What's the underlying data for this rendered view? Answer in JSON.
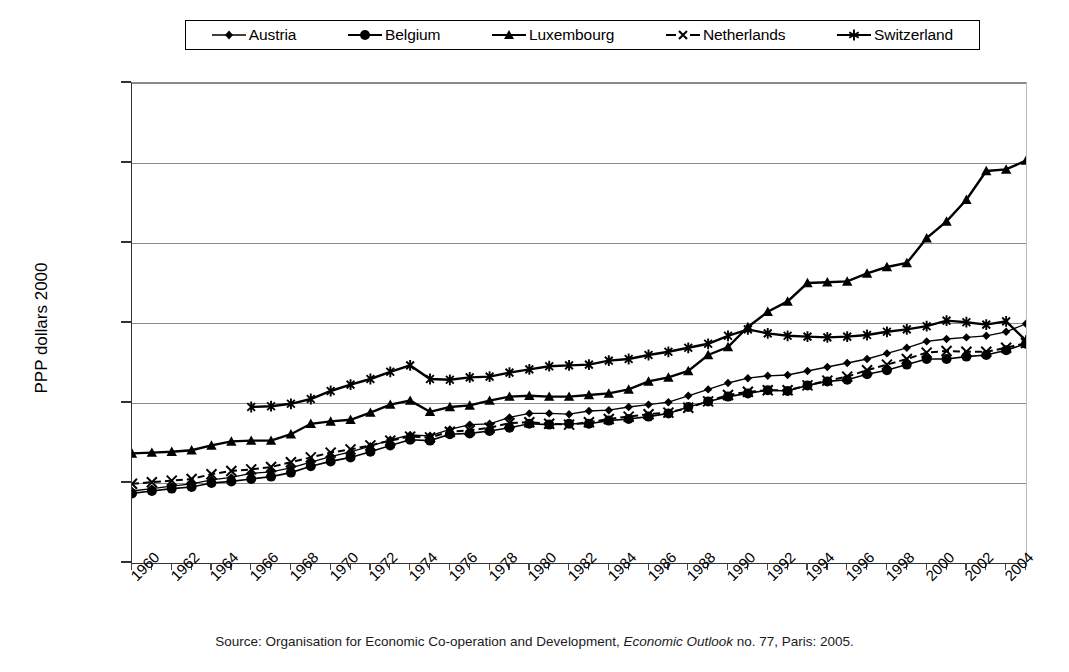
{
  "legend": {
    "items": [
      {
        "label": "Austria",
        "marker": "diamond",
        "line": "solid-thin"
      },
      {
        "label": "Belgium",
        "marker": "circle",
        "line": "solid-thin"
      },
      {
        "label": "Luxembourg",
        "marker": "triangle",
        "line": "solid-thick"
      },
      {
        "label": "Netherlands",
        "marker": "x",
        "line": "dashed"
      },
      {
        "label": "Switzerland",
        "marker": "asterisk",
        "line": "solid-thick"
      }
    ]
  },
  "axes": {
    "y_label": "PPP dollars 2000",
    "y_ticks": [
      "0",
      "10,000",
      "20,000",
      "30,000",
      "40,000",
      "50,000",
      "60,000"
    ],
    "x_ticks": [
      "1960",
      "1962",
      "1964",
      "1966",
      "1968",
      "1970",
      "1972",
      "1974",
      "1976",
      "1978",
      "1980",
      "1982",
      "1984",
      "1986",
      "1988",
      "1990",
      "1992",
      "1994",
      "1996",
      "1998",
      "2000",
      "2002",
      "2004"
    ]
  },
  "source": {
    "prefix": "Source: Organisation for Economic Co-operation and Development, ",
    "italic": "Economic Outlook",
    "suffix": " no. 77, Paris: 2005."
  },
  "chart_data": {
    "type": "line",
    "title": "",
    "xlabel": "",
    "ylabel": "PPP dollars 2000",
    "xlim": [
      1960,
      2005
    ],
    "ylim": [
      0,
      60000
    ],
    "ytick_step": 10000,
    "grid": true,
    "legend_position": "top",
    "x": [
      1960,
      1961,
      1962,
      1963,
      1964,
      1965,
      1966,
      1967,
      1968,
      1969,
      1970,
      1971,
      1972,
      1973,
      1974,
      1975,
      1976,
      1977,
      1978,
      1979,
      1980,
      1981,
      1982,
      1983,
      1984,
      1985,
      1986,
      1987,
      1988,
      1989,
      1990,
      1991,
      1992,
      1993,
      1994,
      1995,
      1996,
      1997,
      1998,
      1999,
      2000,
      2001,
      2002,
      2003,
      2004,
      2005
    ],
    "series": [
      {
        "name": "Austria",
        "color": "#000000",
        "marker": "diamond",
        "values": [
          9000,
          9300,
          9600,
          9900,
          10400,
          10700,
          11200,
          11400,
          11900,
          12600,
          13300,
          13900,
          14600,
          15400,
          16000,
          15900,
          16700,
          17300,
          17400,
          18200,
          18700,
          18700,
          18600,
          19000,
          19100,
          19500,
          19800,
          20100,
          20900,
          21700,
          22500,
          23100,
          23400,
          23500,
          24000,
          24500,
          25000,
          25500,
          26200,
          26900,
          27700,
          28000,
          28200,
          28400,
          28900,
          29900
        ]
      },
      {
        "name": "Belgium",
        "color": "#000000",
        "marker": "circle",
        "values": [
          8700,
          9000,
          9300,
          9500,
          10000,
          10200,
          10500,
          10800,
          11300,
          12100,
          12700,
          13200,
          13900,
          14700,
          15400,
          15300,
          16100,
          16200,
          16500,
          16900,
          17400,
          17300,
          17400,
          17400,
          17800,
          18000,
          18300,
          18700,
          19500,
          20200,
          20800,
          21200,
          21600,
          21500,
          22200,
          22700,
          22900,
          23600,
          24100,
          24800,
          25500,
          25500,
          25800,
          26000,
          26600,
          27400
        ]
      },
      {
        "name": "Luxembourg",
        "color": "#000000",
        "marker": "triangle",
        "values": [
          13700,
          13800,
          13900,
          14100,
          14700,
          15200,
          15300,
          15300,
          16100,
          17400,
          17700,
          17900,
          18800,
          19800,
          20300,
          18900,
          19500,
          19700,
          20300,
          20800,
          20900,
          20800,
          20800,
          21000,
          21200,
          21700,
          22700,
          23200,
          24000,
          26000,
          27000,
          29500,
          31400,
          32700,
          35000,
          35100,
          35200,
          36200,
          37000,
          37500,
          40600,
          42700,
          45400,
          49000,
          49200,
          50300
        ]
      },
      {
        "name": "Netherlands",
        "color": "#000000",
        "marker": "x",
        "values": [
          9900,
          10100,
          10300,
          10500,
          11100,
          11500,
          11700,
          12000,
          12600,
          13200,
          13800,
          14200,
          14700,
          15300,
          15800,
          15700,
          16400,
          16600,
          16900,
          17500,
          17600,
          17400,
          17300,
          17600,
          18000,
          18300,
          18600,
          18800,
          19400,
          20200,
          21000,
          21400,
          21600,
          21600,
          22200,
          22800,
          23300,
          24100,
          24800,
          25500,
          26300,
          26500,
          26400,
          26400,
          26900,
          27500
        ]
      },
      {
        "name": "Switzerland",
        "color": "#000000",
        "marker": "asterisk",
        "values": [
          null,
          null,
          null,
          null,
          null,
          null,
          19500,
          19600,
          19900,
          20500,
          21500,
          22300,
          23000,
          23900,
          24700,
          23000,
          22900,
          23200,
          23300,
          23800,
          24200,
          24600,
          24700,
          24800,
          25300,
          25500,
          26000,
          26400,
          26900,
          27400,
          28400,
          29200,
          28700,
          28400,
          28300,
          28200,
          28300,
          28500,
          28900,
          29200,
          29600,
          30300,
          30100,
          29800,
          30200,
          27800
        ]
      }
    ]
  }
}
